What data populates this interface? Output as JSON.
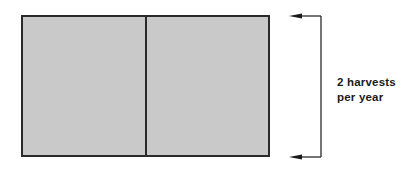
{
  "diagram": {
    "field": {
      "plots": [
        {
          "name": "harvest-1"
        },
        {
          "name": "harvest-2"
        }
      ],
      "fill_color": "#c8c8c8",
      "border_color": "#2a2a2a"
    },
    "annotation": {
      "line1": "2 harvests",
      "line2": "per year"
    }
  }
}
